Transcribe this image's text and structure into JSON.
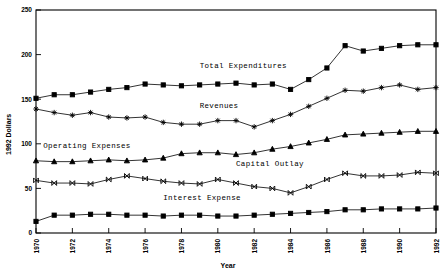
{
  "chart_data": {
    "type": "line",
    "title": "",
    "xlabel": "Year",
    "ylabel": "1992 Dollars",
    "xlim": [
      1970,
      1992
    ],
    "ylim": [
      0,
      250
    ],
    "grid": false,
    "legend_position": "inline-annotations",
    "x": [
      1970,
      1971,
      1972,
      1973,
      1974,
      1975,
      1976,
      1977,
      1978,
      1979,
      1980,
      1981,
      1982,
      1983,
      1984,
      1985,
      1986,
      1987,
      1988,
      1989,
      1990,
      1991,
      1992
    ],
    "xticks": [
      1970,
      1972,
      1974,
      1976,
      1978,
      1980,
      1982,
      1984,
      1986,
      1988,
      1990,
      1992
    ],
    "xtick_labels": [
      "1970",
      "1972",
      "1974",
      "1976",
      "1978",
      "1980",
      "1982",
      "1984",
      "1986",
      "1988",
      "1990",
      "1992"
    ],
    "yticks": [
      0,
      50,
      100,
      150,
      200,
      250
    ],
    "ytick_labels": [
      "0",
      "50",
      "100",
      "150",
      "200",
      "250"
    ],
    "series": [
      {
        "name": "Total Expenditures",
        "marker": "filled-square",
        "label_x": 1979.0,
        "label_y": 185,
        "values": [
          151,
          155,
          155,
          158,
          161,
          163,
          167,
          166,
          165,
          166,
          167,
          168,
          166,
          167,
          161,
          172,
          185,
          210,
          204,
          207,
          210,
          211,
          211
        ]
      },
      {
        "name": "Revenues",
        "marker": "plus",
        "label_x": 1979.0,
        "label_y": 140,
        "values": [
          139,
          135,
          132,
          135,
          130,
          129,
          130,
          124,
          122,
          122,
          126,
          126,
          119,
          126,
          133,
          142,
          151,
          160,
          159,
          163,
          166,
          161,
          163
        ]
      },
      {
        "name": "Operating Expenses",
        "marker": "triangle",
        "label_x": 1970.4,
        "label_y": 95,
        "values": [
          81,
          80,
          80,
          81,
          82,
          81,
          82,
          84,
          89,
          90,
          90,
          88,
          90,
          94,
          97,
          101,
          105,
          110,
          111,
          112,
          113,
          114,
          114
        ]
      },
      {
        "name": "Capital Outlay",
        "marker": "cross-x",
        "label_x": 1981.0,
        "label_y": 75,
        "values": [
          59,
          56,
          56,
          55,
          60,
          64,
          61,
          58,
          56,
          55,
          60,
          56,
          52,
          50,
          45,
          52,
          60,
          67,
          64,
          64,
          65,
          68,
          67
        ]
      },
      {
        "name": "Interest Expense",
        "marker": "filled-square",
        "label_x": 1977.0,
        "label_y": 37,
        "values": [
          13,
          20,
          20,
          21,
          21,
          20,
          20,
          19,
          20,
          20,
          19,
          19,
          20,
          21,
          22,
          23,
          24,
          26,
          26,
          27,
          27,
          27,
          28
        ]
      }
    ]
  }
}
